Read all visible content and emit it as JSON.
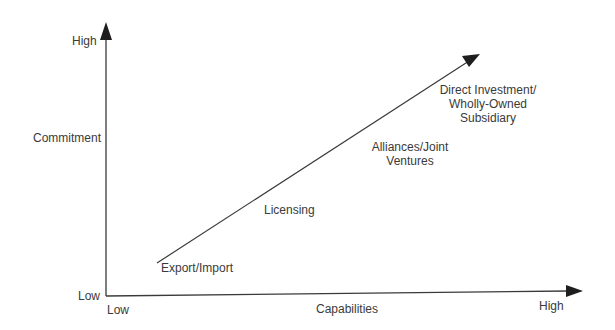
{
  "diagram": {
    "title": "",
    "y_axis": {
      "label": "Commitment",
      "high": "High",
      "low": "Low"
    },
    "x_axis": {
      "label": "Capabilities",
      "high": "High",
      "low": "Low"
    },
    "stages": [
      {
        "label": "Export/Import"
      },
      {
        "label": "Licensing"
      },
      {
        "label": "Alliances/Joint Ventures",
        "lines": [
          "Alliances/Joint",
          "Ventures"
        ]
      },
      {
        "label": "Direct Investment/ Wholly-Owned Subsidiary",
        "lines": [
          "Direct Investment/",
          "Wholly-Owned",
          "Subsidiary"
        ]
      }
    ],
    "colors": {
      "line": "#3a3a3a",
      "text": "#3a3a3a",
      "background": "#ffffff"
    }
  }
}
